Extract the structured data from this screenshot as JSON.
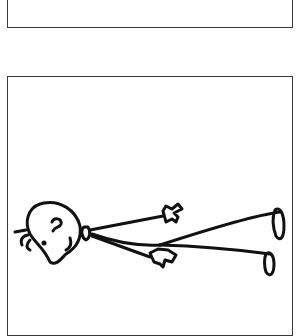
{
  "comic": {
    "panels": [
      {
        "name": "top-panel",
        "content": "empty"
      },
      {
        "name": "bottom-panel",
        "content": "stick figure lying on back, feet up to the right, head to the left"
      }
    ],
    "colors": {
      "ink": "#111111",
      "border": "#3a3a3a",
      "background": "#ffffff"
    }
  }
}
